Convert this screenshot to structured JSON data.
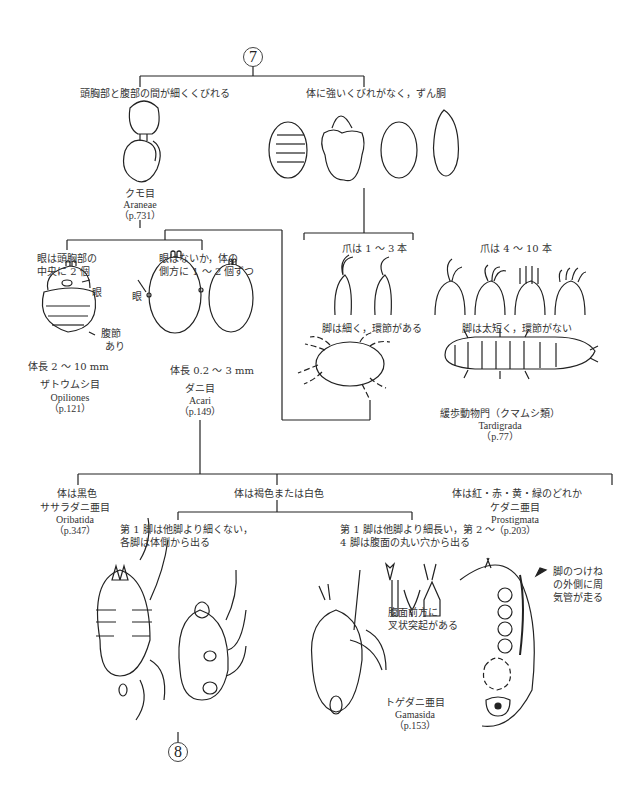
{
  "nodes": {
    "top": "7",
    "bottom": "8"
  },
  "branch_top": {
    "left_label": "頭胸部と腹部の間が細くくびれる",
    "right_label": "体に強いくびれがなく，ずん胴"
  },
  "araneae": {
    "ja": "クモ目",
    "latin": "Araneae",
    "page": "（p.731）"
  },
  "spider_split": {
    "left_label_1": "眼は頭胸部の",
    "left_label_2": "中央に 2 個",
    "right_label_1": "眼はないか，体の",
    "right_label_2": "側方に 1 〜 2 個ずつ"
  },
  "opiliones": {
    "eye_label": "眼",
    "segment_label_1": "腹節",
    "segment_label_2": "あり",
    "size": "体長 2 〜 10 mm",
    "ja": "ザトウムシ目",
    "latin": "Opiliones",
    "page": "（p.121）"
  },
  "acari": {
    "eye_label": "眼",
    "size": "体長 0.2 〜 3 mm",
    "ja": "ダニ目",
    "latin": "Acari",
    "page": "（p.149）"
  },
  "claw_split": {
    "left_label": "爪は 1 〜 3 本",
    "right_label": "爪は 4 〜 10 本",
    "left_desc": "脚は細く，環節がある",
    "right_desc": "脚は太短く，環節がない"
  },
  "tardigrada": {
    "ja": "緩歩動物門（クマムシ類）",
    "latin": "Tardigrada",
    "page": "（p.77）"
  },
  "acari_split": {
    "black": "体は黒色",
    "brown_white": "体は褐色または白色",
    "colored": "体は紅・赤・黄・緑のどれか"
  },
  "oribatida": {
    "ja": "ササラダニ亜目",
    "latin": "Oribatida",
    "page": "（p.347）"
  },
  "prostigmata": {
    "ja": "ケダニ亜目",
    "latin": "Prostigmata",
    "page": "（p.203）"
  },
  "leg_split": {
    "left_1": "第 1 脚は他脚より細くない，",
    "left_2": "各脚は体側から出る",
    "right_1": "第 1 脚は他脚より細長い，第 2 〜",
    "right_2": "4 脚は腹面の丸い穴から出る"
  },
  "gamasida": {
    "fork_label_1": "腹面前方に",
    "fork_label_2": "叉状突起がある",
    "stigma_label_1": "脚のつけね",
    "stigma_label_2": "の外側に周",
    "stigma_label_3": "気管が走る",
    "ja": "トゲダニ亜目",
    "latin": "Gamasida",
    "page": "（p.153）"
  }
}
